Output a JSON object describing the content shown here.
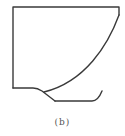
{
  "figure": {
    "caption": "(b)",
    "stroke_color": "#3a3a3a",
    "shapes": [
      {
        "name": "outline",
        "description": "open box with top edge, left edge, right edge and curved lower-right"
      },
      {
        "name": "curve",
        "description": "concave curve from upper-right to lower-left meeting the base"
      },
      {
        "name": "base-hook",
        "description": "lower slanted line ending in a bottom flat with upturned hook"
      }
    ]
  }
}
